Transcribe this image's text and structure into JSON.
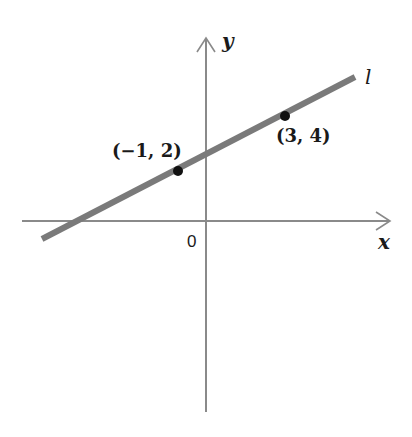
{
  "diagram": {
    "type": "coordinate-plane-line",
    "axes": {
      "x_label": "x",
      "y_label": "y",
      "origin_label": "0"
    },
    "line": {
      "label": "l",
      "color": "#7a7a7a"
    },
    "points": [
      {
        "label": "(−1, 2)",
        "x": -1,
        "y": 2
      },
      {
        "label": "(3, 4)",
        "x": 3,
        "y": 4
      }
    ],
    "colors": {
      "axis": "#8a8a8a",
      "point": "#111111",
      "text": "#1a1a1a",
      "background": "#ffffff"
    }
  }
}
